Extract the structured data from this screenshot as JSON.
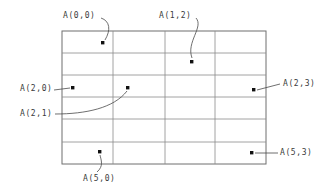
{
  "diagram": {
    "kind": "array-index-grid",
    "background_color": "#ffffff",
    "grid": {
      "rows": 6,
      "columns": 4,
      "left": 62,
      "top": 31,
      "right": 266,
      "bottom": 164,
      "row_indices": [
        0,
        1,
        2,
        3,
        4,
        5
      ],
      "column_indices": [
        0,
        1,
        2,
        3
      ],
      "column_dividers_x": [
        113,
        165,
        215
      ],
      "row_dividers_y": [
        53,
        75,
        97,
        119,
        142
      ],
      "border_color": "#6f6f6f",
      "line_color": "#8a8a8a"
    },
    "markers": [
      {
        "id": "marker-0-0",
        "label": "A(0,0)",
        "row": 0,
        "column": 0,
        "dot_x": 103,
        "dot_y": 43,
        "label_x": 63,
        "label_y": 12,
        "leader": "M 101,18 C 110,21 111,30 105,40",
        "color": "#111111"
      },
      {
        "id": "marker-1-2",
        "label": "A(1,2)",
        "row": 1,
        "column": 2,
        "dot_x": 192,
        "dot_y": 62,
        "label_x": 159,
        "label_y": 12,
        "leader": "M 196,18 C 204,27 186,42 192,58",
        "color": "#111111"
      },
      {
        "id": "marker-2-0",
        "label": "A(2,0)",
        "row": 2,
        "column": 0,
        "dot_x": 73,
        "dot_y": 88,
        "label_x": 20,
        "label_y": 85,
        "leader": "M 54,90 L 70,88",
        "color": "#111111"
      },
      {
        "id": "marker-2-1",
        "label": "A(2,1)",
        "row": 2,
        "column": 1,
        "dot_x": 128,
        "dot_y": 88,
        "label_x": 20,
        "label_y": 110,
        "leader": "M 55,114 C 86,114 114,108 127,91",
        "color": "#111111"
      },
      {
        "id": "marker-2-3",
        "label": "A(2,3)",
        "row": 2,
        "column": 3,
        "dot_x": 254,
        "dot_y": 90,
        "label_x": 283,
        "label_y": 80,
        "leader": "M 280,84 L 257,90",
        "color": "#111111"
      },
      {
        "id": "marker-5-0",
        "label": "A(5,0)",
        "row": 5,
        "column": 0,
        "dot_x": 100,
        "dot_y": 152,
        "label_x": 83,
        "label_y": 175,
        "leader": "M 97,172 C 104,166 101,160 100,155",
        "color": "#111111"
      },
      {
        "id": "marker-5-3",
        "label": "A(5,3)",
        "row": 5,
        "column": 3,
        "dot_x": 252,
        "dot_y": 153,
        "label_x": 280,
        "label_y": 149,
        "leader": "M 278,153 L 255,153",
        "color": "#111111"
      }
    ]
  }
}
